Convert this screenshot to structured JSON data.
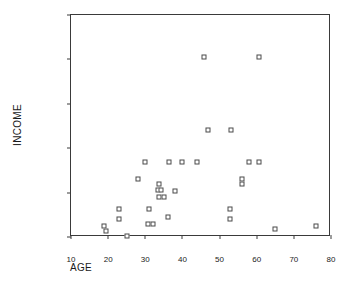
{
  "chart_data": {
    "type": "scatter",
    "title": "",
    "xlabel": "AGE",
    "ylabel": "INCOME",
    "xlim": [
      10,
      80
    ],
    "ylim": [
      0,
      100000
    ],
    "xticks": [
      10,
      20,
      30,
      40,
      50,
      60,
      70,
      80
    ],
    "yticks": [
      0,
      20000,
      40000,
      60000,
      80000,
      100000
    ],
    "xtick_labels": [
      "10",
      "20",
      "30",
      "40",
      "50",
      "60",
      "70",
      "80"
    ],
    "ytick_labels": [
      "0",
      "20000",
      "40000",
      "60000",
      "80000",
      "100000"
    ],
    "grid": false,
    "legend": null,
    "marker": "open-square",
    "marker_color": "#4a4a4a",
    "points": [
      {
        "x": 19,
        "y": 5000
      },
      {
        "x": 19.5,
        "y": 2800
      },
      {
        "x": 23,
        "y": 12500
      },
      {
        "x": 22.8,
        "y": 8000
      },
      {
        "x": 25,
        "y": 400
      },
      {
        "x": 28,
        "y": 26000
      },
      {
        "x": 30,
        "y": 34000
      },
      {
        "x": 31,
        "y": 12500
      },
      {
        "x": 30.7,
        "y": 6000
      },
      {
        "x": 32,
        "y": 6000
      },
      {
        "x": 33.6,
        "y": 24000
      },
      {
        "x": 33.3,
        "y": 21000
      },
      {
        "x": 34.3,
        "y": 21000
      },
      {
        "x": 33.6,
        "y": 18000
      },
      {
        "x": 35,
        "y": 18000
      },
      {
        "x": 36,
        "y": 9000
      },
      {
        "x": 36.3,
        "y": 34000
      },
      {
        "x": 38,
        "y": 20500
      },
      {
        "x": 40,
        "y": 34000
      },
      {
        "x": 44,
        "y": 34000
      },
      {
        "x": 45.8,
        "y": 81000
      },
      {
        "x": 46.8,
        "y": 48000
      },
      {
        "x": 52.8,
        "y": 12500
      },
      {
        "x": 52.8,
        "y": 8000
      },
      {
        "x": 53,
        "y": 48000
      },
      {
        "x": 56,
        "y": 26000
      },
      {
        "x": 56,
        "y": 24000
      },
      {
        "x": 58,
        "y": 34000
      },
      {
        "x": 60.5,
        "y": 34000
      },
      {
        "x": 60.7,
        "y": 81000
      },
      {
        "x": 65,
        "y": 3800
      },
      {
        "x": 76,
        "y": 5000
      }
    ]
  }
}
